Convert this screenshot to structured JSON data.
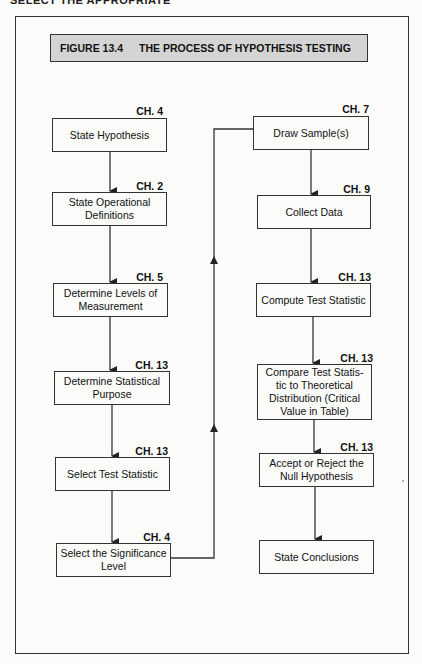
{
  "page_header_fragment": "SELECT THE APPROPRIATE",
  "figure": {
    "number": "FIGURE 13.4",
    "title": "THE PROCESS OF HYPOTHESIS TESTING"
  },
  "left_column": [
    {
      "chapter": "CH. 4",
      "label": "State Hypothesis"
    },
    {
      "chapter": "CH. 2",
      "label": "State Operational Definitions"
    },
    {
      "chapter": "CH. 5",
      "label": "Determine Levels of Measurement"
    },
    {
      "chapter": "CH. 13",
      "label": "Determine Statistical Purpose"
    },
    {
      "chapter": "CH. 13",
      "label": "Select Test Statistic"
    },
    {
      "chapter": "CH. 4",
      "label": "Select the Significance Level"
    }
  ],
  "right_column": [
    {
      "chapter": "CH. 7",
      "label": "Draw Sample(s)"
    },
    {
      "chapter": "CH. 9",
      "label": "Collect Data"
    },
    {
      "chapter": "CH. 13",
      "label": "Compute Test Statistic"
    },
    {
      "chapter": "CH. 13",
      "label": "Compare Test Statis-tic to Theoretical Distribution (Critical Value in Table)"
    },
    {
      "chapter": "CH. 13",
      "label": "Accept or Reject the Null Hypothesis"
    },
    {
      "chapter": "",
      "label": "State Conclusions"
    }
  ],
  "colors": {
    "title_fill": "#d4d4d4",
    "line": "#333333",
    "background": "#fbfbfa"
  }
}
